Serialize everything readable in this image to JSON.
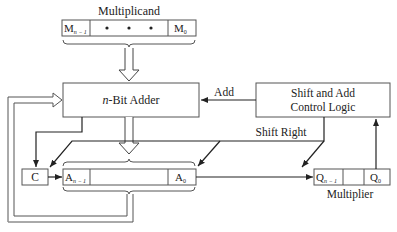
{
  "title": "Multiplicand",
  "multiplicand": {
    "label": "Multiplicand",
    "msb": {
      "base": "M",
      "sub": "n − 1"
    },
    "lsb": {
      "base": "M",
      "sub": "0"
    },
    "middle": "•   •   •"
  },
  "adder": {
    "prefix": "n",
    "label": "-Bit Adder"
  },
  "control": {
    "line1": "Shift and Add",
    "line2": "Control Logic"
  },
  "signals": {
    "add": "Add",
    "shift_right": "Shift Right"
  },
  "carry": {
    "label": "C"
  },
  "accumulator": {
    "msb": {
      "base": "A",
      "sub": "n − 1"
    },
    "lsb": {
      "base": "A",
      "sub": "0"
    }
  },
  "multiplier": {
    "label": "Multiplier",
    "msb": {
      "base": "Q",
      "sub": "n − 1"
    },
    "lsb": {
      "base": "Q",
      "sub": "0"
    }
  },
  "colors": {
    "line": "#2a2a2a",
    "box_stroke": "#555555",
    "background": "#ffffff"
  }
}
